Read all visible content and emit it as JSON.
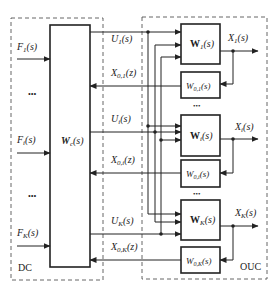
{
  "diagram": {
    "regions": {
      "dc": {
        "label": "DC"
      },
      "ouc": {
        "label": "OUC"
      }
    },
    "controller_block": {
      "label_main": "W",
      "label_sub": "c",
      "label_arg": "(s)"
    },
    "inputs": [
      {
        "main": "F",
        "sub": "1",
        "arg": "(s)"
      },
      {
        "main": "F",
        "sub": "i",
        "arg": "(s)"
      },
      {
        "main": "F",
        "sub": "K",
        "arg": "(s)"
      }
    ],
    "ellipsis": "•••",
    "control_signals": [
      {
        "main": "U",
        "sub": "1",
        "arg": "(s)"
      },
      {
        "main": "U",
        "sub": "i",
        "arg": "(s)"
      },
      {
        "main": "U",
        "sub": "K",
        "arg": "(s)"
      }
    ],
    "feedback_signals": [
      {
        "main": "X",
        "sub": "0,1",
        "arg": "(z)"
      },
      {
        "main": "X",
        "sub": "0,i",
        "arg": "(z)"
      },
      {
        "main": "X",
        "sub": "0,K",
        "arg": "(z)"
      }
    ],
    "plant_blocks": [
      {
        "main": "W",
        "sub": "1",
        "arg": "(s)"
      },
      {
        "main": "W",
        "sub": "i",
        "arg": "(s)"
      },
      {
        "main": "W",
        "sub": "K",
        "arg": "(s)"
      }
    ],
    "observer_blocks": [
      {
        "main": "W",
        "sub": "0,1",
        "arg": "(s)"
      },
      {
        "main": "W",
        "sub": "0,i",
        "arg": "(s)"
      },
      {
        "main": "W",
        "sub": "0,K",
        "arg": "(s)"
      }
    ],
    "outputs": [
      {
        "main": "X",
        "sub": "1",
        "arg": "(s)"
      },
      {
        "main": "X",
        "sub": "i",
        "arg": "(s)"
      },
      {
        "main": "X",
        "sub": "K",
        "arg": "(s)"
      }
    ]
  }
}
